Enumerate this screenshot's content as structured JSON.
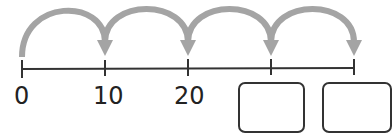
{
  "number_line": {
    "labels": [
      "0",
      "10",
      "20",
      "",
      ""
    ],
    "jump_size": 10,
    "answer_boxes": 2
  },
  "colors": {
    "arc": "#a4a4a4",
    "line": "#333333"
  }
}
